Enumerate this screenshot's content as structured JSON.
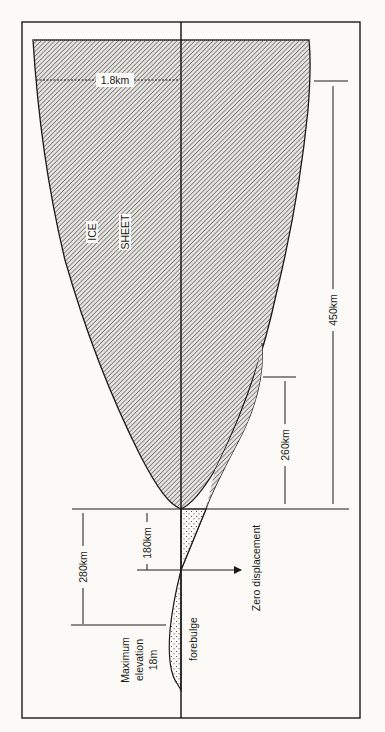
{
  "diagram": {
    "labels": {
      "ice": "ICE",
      "sheet": "SHEET",
      "thickness": "1.8km",
      "ice_extent": "450km",
      "depression_extent": "260km",
      "to_zero": "180km",
      "to_forebulge_peak": "280km",
      "zero_displacement": "Zero displacement",
      "forebulge": "forebulge",
      "max_elev_line1": "Maximum",
      "max_elev_line2": "elevation",
      "max_elev_line3": "18m"
    },
    "colors": {
      "line": "#1a1a1a",
      "hatch": "#6b6b6b",
      "background": "#fbfaf6"
    }
  }
}
